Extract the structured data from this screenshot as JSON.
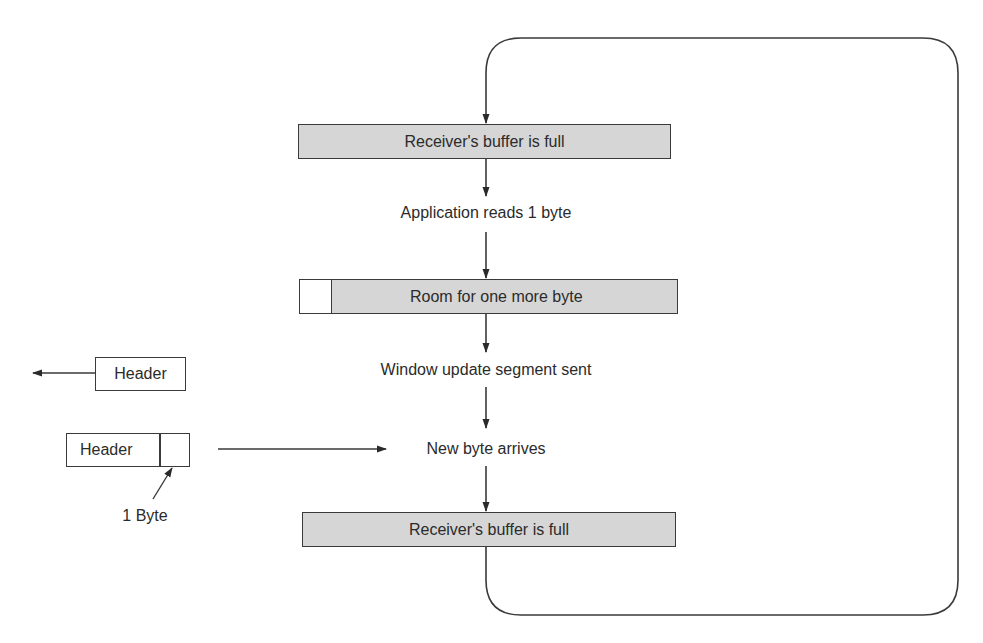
{
  "diagram": {
    "type": "flow-loop",
    "states": [
      {
        "id": "s1",
        "label": "Receiver's buffer is full",
        "style": "shaded-box"
      },
      {
        "id": "s2",
        "label": "Application reads 1 byte",
        "style": "text"
      },
      {
        "id": "s3",
        "label": "Room for one more byte",
        "style": "shaded-box-with-empty-slot"
      },
      {
        "id": "s4",
        "label": "Window update segment sent",
        "style": "text"
      },
      {
        "id": "s5",
        "label": "New byte arrives",
        "style": "text"
      },
      {
        "id": "s6",
        "label": "Receiver's buffer is full",
        "style": "shaded-box"
      }
    ],
    "side_elements": {
      "outgoing_segment": {
        "label": "Header",
        "direction": "left"
      },
      "incoming_segment": {
        "header_label": "Header",
        "byte_annotation": "1 Byte",
        "direction": "right"
      }
    },
    "loop": {
      "from": "s6",
      "to": "s1",
      "shape": "rounded-rectangle"
    },
    "colors": {
      "box_fill": "#d6d6d6",
      "stroke": "#3a3a3a",
      "text": "#2b2b2b"
    }
  }
}
